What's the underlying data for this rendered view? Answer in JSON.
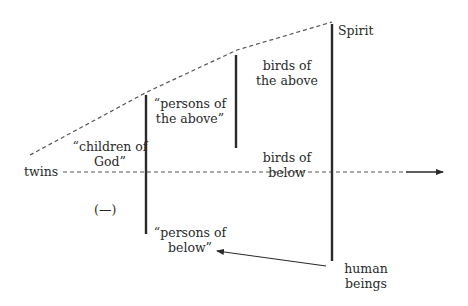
{
  "diagram": {
    "labels": {
      "spirit": "Spirit",
      "birds_above_1": "birds of",
      "birds_above_2": "the above",
      "persons_above_1": "“persons of",
      "persons_above_2": "the above”",
      "children_1": "“children of",
      "children_2": "God”",
      "twins": "twins",
      "birds_below_1": "birds of",
      "birds_below_2": "below",
      "neutral": "(—)",
      "persons_below_1": "“persons of",
      "persons_below_2": "below”",
      "human_1": "human",
      "human_2": "beings"
    },
    "colors": {
      "line": "#2a2a2a",
      "dashed": "#555555",
      "background": "#ffffff"
    }
  }
}
